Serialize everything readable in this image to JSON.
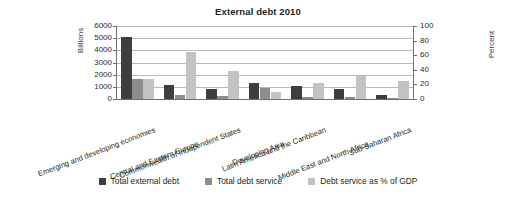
{
  "chart_data": {
    "type": "bar",
    "title": "External debt 2010",
    "xlabel": "",
    "ylabel": "Billions",
    "y2label": "Percent",
    "ylim": [
      0,
      6000
    ],
    "y2lim": [
      0,
      100
    ],
    "yticks": [
      0,
      1000,
      2000,
      3000,
      4000,
      5000,
      6000
    ],
    "y2ticks": [
      0,
      20,
      40,
      60,
      80,
      100
    ],
    "grid": true,
    "legend_position": "bottom",
    "categories": [
      "Emerging and developing economies",
      "Central and Eastern Europe",
      "Commonwealth of Independent States",
      "Developing Asia",
      "Latin America and the Caribbean",
      "Middle East and North Africa",
      "Sub-Saharan Africa"
    ],
    "series": [
      {
        "name": "Total external debt",
        "axis": "left",
        "unit": "Billions",
        "color": "#3e3e3e",
        "values": [
          5100,
          1150,
          850,
          1300,
          1050,
          800,
          350
        ]
      },
      {
        "name": "Total debt service",
        "axis": "left",
        "unit": "Billions",
        "color": "#8d8d8d",
        "values": [
          1650,
          300,
          270,
          900,
          170,
          130,
          90
        ]
      },
      {
        "name": "Debt service as % of GDP",
        "axis": "right",
        "unit": "Percent",
        "color": "#c3c3c3",
        "values": [
          27,
          65,
          39,
          10,
          22,
          32,
          24
        ]
      }
    ]
  },
  "legend": {
    "items": [
      {
        "label": "Total external debt",
        "color": "#3e3e3e"
      },
      {
        "label": "Total debt service",
        "color": "#8d8d8d"
      },
      {
        "label": "Debt service as % of GDP",
        "color": "#c3c3c3"
      }
    ]
  }
}
